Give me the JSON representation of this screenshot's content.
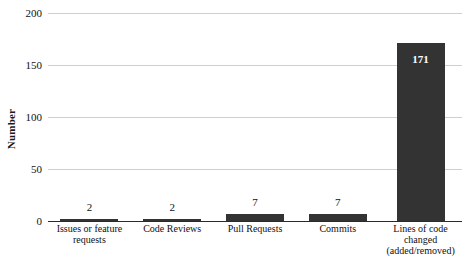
{
  "chart_data": {
    "type": "bar",
    "title": "",
    "subtitle": "",
    "xlabel": "",
    "ylabel": "Number",
    "categories": [
      "Issues or feature requests",
      "Code Reviews",
      "Pull Requests",
      "Commits",
      "Lines of code changed (added/removed)"
    ],
    "category_lines": [
      [
        "Issues or feature",
        "requests"
      ],
      [
        "Code Reviews"
      ],
      [
        "Pull Requests"
      ],
      [
        "Commits"
      ],
      [
        "Lines of code",
        "changed",
        "(added/removed)"
      ]
    ],
    "values": [
      2,
      2,
      7,
      7,
      171
    ],
    "value_labels": [
      "2",
      "2",
      "7",
      "7",
      "171"
    ],
    "ylim": [
      0,
      200
    ],
    "yticks": [
      0,
      50,
      100,
      150,
      200
    ],
    "ytick_labels": [
      "0",
      "50",
      "100",
      "150",
      "200"
    ],
    "grid": true,
    "legend": false,
    "legend_position": "none",
    "bar_color": "#333333",
    "grid_color": "#cfcfcf",
    "axis_color": "#2b2b2b",
    "value_label_color": "#111111",
    "inside_label_color": "#ffffff"
  }
}
